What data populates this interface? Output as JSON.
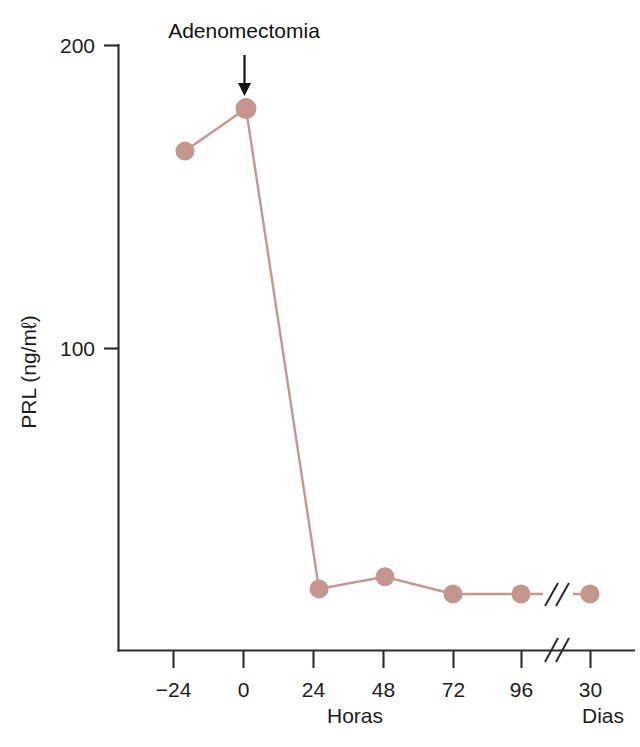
{
  "chart_data": {
    "type": "line",
    "title": "",
    "xlabel": "Horas",
    "xlabel_secondary": "Dias",
    "ylabel": "PRL (ng/mℓ)",
    "x_tick_labels": [
      "−24",
      "0",
      "24",
      "48",
      "72",
      "96",
      "30"
    ],
    "y_tick_labels": [
      "100",
      "200"
    ],
    "ylim": [
      0,
      200
    ],
    "grid": false,
    "legend": "none",
    "axis_break_x": true,
    "series": [
      {
        "name": "PRL",
        "color": "#c4968e",
        "marker": "circle",
        "x": [
          "−24",
          "0",
          "24",
          "48",
          "72",
          "96",
          "30"
        ],
        "values": [
          165,
          179,
          20.5,
          24.5,
          18.8,
          18.8,
          18.8
        ]
      }
    ],
    "annotations": [
      {
        "text": "Adenomectomia",
        "at_x": "0",
        "type": "arrow-down"
      }
    ]
  },
  "axes": {
    "y_tick_200": "200",
    "y_tick_100": "100",
    "y_title": "PRL (ng/mℓ)",
    "x_title": "Horas",
    "x_title_right": "Dias",
    "x_ticks": {
      "t0": "−24",
      "t1": "0",
      "t2": "24",
      "t3": "48",
      "t4": "72",
      "t5": "96",
      "t6": "30"
    }
  },
  "annotation": {
    "label": "Adenomectomia"
  },
  "colors": {
    "series": "#c4968e",
    "axis": "#2b2b2b",
    "text": "#1c1c1c"
  }
}
